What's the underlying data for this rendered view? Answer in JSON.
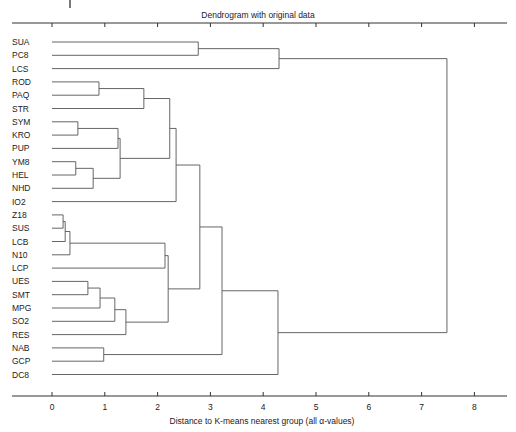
{
  "chart_data": {
    "type": "dendrogram",
    "title": "Dendrogram with original data",
    "xlabel": "Distance to K-means nearest group (all α-values)",
    "ylabel": "",
    "xlim": [
      -0.9,
      8.5
    ],
    "xticks": [
      0,
      1,
      2,
      3,
      4,
      5,
      6,
      7,
      8
    ],
    "grid": false,
    "orientation": "horizontal",
    "leaves": [
      "SUA",
      "PC8",
      "LCS",
      "ROD",
      "PAQ",
      "STR",
      "SYM",
      "KRO",
      "PUP",
      "YM8",
      "HEL",
      "NHD",
      "IO2",
      "Z18",
      "SUS",
      "LCB",
      "N10",
      "LCP",
      "UES",
      "SMT",
      "MPG",
      "SO2",
      "RES",
      "NAB",
      "GCP",
      "DC8"
    ],
    "merges": [
      {
        "id": "c1",
        "left": "SUA",
        "right": "PC8",
        "height": 2.77
      },
      {
        "id": "c2",
        "left": "c1",
        "right": "LCS",
        "height": 4.3
      },
      {
        "id": "c3",
        "left": "ROD",
        "right": "PAQ",
        "height": 0.89
      },
      {
        "id": "c4",
        "left": "c3",
        "right": "STR",
        "height": 1.74
      },
      {
        "id": "c5",
        "left": "SYM",
        "right": "KRO",
        "height": 0.49
      },
      {
        "id": "c6",
        "left": "c5",
        "right": "PUP",
        "height": 1.25
      },
      {
        "id": "c7",
        "left": "YM8",
        "right": "HEL",
        "height": 0.45
      },
      {
        "id": "c8",
        "left": "c7",
        "right": "NHD",
        "height": 0.78
      },
      {
        "id": "c9",
        "left": "c6",
        "right": "c8",
        "height": 1.29
      },
      {
        "id": "c10",
        "left": "c4",
        "right": "c9",
        "height": 2.23
      },
      {
        "id": "c11",
        "left": "c10",
        "right": "IO2",
        "height": 2.35
      },
      {
        "id": "c12",
        "left": "Z18",
        "right": "SUS",
        "height": 0.21
      },
      {
        "id": "c13",
        "left": "c12",
        "right": "LCB",
        "height": 0.25
      },
      {
        "id": "c14",
        "left": "c13",
        "right": "N10",
        "height": 0.34
      },
      {
        "id": "c15",
        "left": "c14",
        "right": "LCP",
        "height": 2.14
      },
      {
        "id": "c16",
        "left": "UES",
        "right": "SMT",
        "height": 0.68
      },
      {
        "id": "c17",
        "left": "c16",
        "right": "MPG",
        "height": 0.91
      },
      {
        "id": "c18",
        "left": "c17",
        "right": "SO2",
        "height": 1.19
      },
      {
        "id": "c19",
        "left": "c18",
        "right": "RES",
        "height": 1.4
      },
      {
        "id": "c20",
        "left": "c15",
        "right": "c19",
        "height": 2.2
      },
      {
        "id": "c21",
        "left": "c11",
        "right": "c20",
        "height": 2.8
      },
      {
        "id": "c22",
        "left": "NAB",
        "right": "GCP",
        "height": 0.98
      },
      {
        "id": "c23",
        "left": "c21",
        "right": "c22",
        "height": 3.22
      },
      {
        "id": "c24",
        "left": "c23",
        "right": "DC8",
        "height": 4.28
      },
      {
        "id": "c25",
        "left": "c2",
        "right": "c24",
        "height": 7.48
      }
    ]
  },
  "layout": {
    "x0_px": 52,
    "px_per_unit": 52.8,
    "axis_left_px": 12,
    "axis_right_px": 507,
    "top_axis_y": 23,
    "bottom_axis_y": 396,
    "first_leaf_y": 42,
    "leaf_step": 13.3,
    "leaf_line_start_px": 52,
    "label_x": 12
  }
}
